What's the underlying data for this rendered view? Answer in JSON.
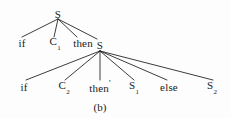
{
  "figure": {
    "caption": "(b)",
    "ink_color": "#1a1a1a",
    "background_color": "#fdfdfd",
    "width": 231,
    "height": 118
  },
  "tree": {
    "root": {
      "label": "S",
      "x": 58,
      "y": 14
    },
    "level2": [
      {
        "label": "if",
        "sub": "",
        "prime": "",
        "x": 22,
        "y": 43
      },
      {
        "label": "C",
        "sub": "1",
        "prime": "",
        "x": 55,
        "y": 43
      },
      {
        "label": "then",
        "sub": "",
        "prime": "",
        "x": 83,
        "y": 43
      },
      {
        "label": "S",
        "sub": "",
        "prime": "",
        "x": 100,
        "y": 45
      }
    ],
    "level3": [
      {
        "label": "if",
        "sub": "",
        "prime": "",
        "x": 24,
        "y": 87
      },
      {
        "label": "C",
        "sub": "2",
        "prime": "",
        "x": 64,
        "y": 87
      },
      {
        "label": "then",
        "sub": "",
        "prime": "'",
        "x": 100,
        "y": 87
      },
      {
        "label": "S",
        "sub": "1",
        "prime": "",
        "x": 134,
        "y": 87
      },
      {
        "label": "else",
        "sub": "",
        "prime": "",
        "x": 169,
        "y": 87
      },
      {
        "label": "S",
        "sub": "2",
        "prime": "",
        "x": 212,
        "y": 87
      }
    ]
  }
}
